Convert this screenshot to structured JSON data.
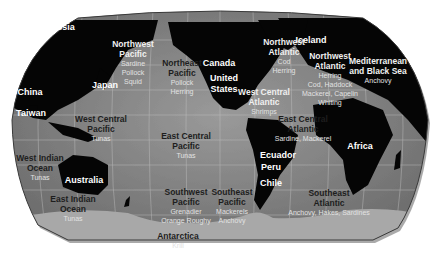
{
  "map": {
    "title": "World fishing regions",
    "colors": {
      "ocean": "#8c8c8c",
      "land": "#050505",
      "antarctica": "#a8a8a8",
      "grid": "#b8b8b8",
      "region_label": "#1e1e1e",
      "species_label": "#e2e2e2",
      "country_label": "#ffffff"
    },
    "countries": [
      {
        "name": "Russia",
        "x": 52,
        "y": 12
      },
      {
        "name": "China",
        "x": 22,
        "y": 77
      },
      {
        "name": "Japan",
        "x": 97,
        "y": 70
      },
      {
        "name": "Taiwan",
        "x": 23,
        "y": 98
      },
      {
        "name": "Australia",
        "x": 76,
        "y": 165
      },
      {
        "name": "Canada",
        "x": 211,
        "y": 48
      },
      {
        "name": "United",
        "x": 216,
        "y": 63
      },
      {
        "name": "States",
        "x": 216,
        "y": 74
      },
      {
        "name": "Iceland",
        "x": 303,
        "y": 25
      },
      {
        "name": "Africa",
        "x": 352,
        "y": 131
      },
      {
        "name": "Ecuador",
        "x": 270,
        "y": 140
      },
      {
        "name": "Peru",
        "x": 263,
        "y": 152
      },
      {
        "name": "Chile",
        "x": 263,
        "y": 168
      }
    ],
    "regions": [
      {
        "name": [
          "Northwest",
          "Pacific"
        ],
        "species": [
          "Sardine",
          "Pollock",
          "Squid"
        ],
        "x": 125,
        "y": 29,
        "tone": "light"
      },
      {
        "name": [
          "Northeast",
          "Pacific"
        ],
        "species": [
          "Pollock",
          "Herring"
        ],
        "x": 174,
        "y": 48,
        "tone": "dark"
      },
      {
        "name": [
          "Northwest",
          "Atlantic"
        ],
        "species": [
          "Cod",
          "Herring"
        ],
        "x": 276,
        "y": 27,
        "tone": "light"
      },
      {
        "name": [
          "Northwest",
          "Atlantic"
        ],
        "species": [
          "Herring",
          "Cod, Haddock",
          "Mackerel, Capelin",
          "Whiting"
        ],
        "x": 322,
        "y": 41,
        "tone": "light"
      },
      {
        "name": [
          "Mediterranean",
          "and Black Sea"
        ],
        "species": [
          "Anchovy"
        ],
        "x": 370,
        "y": 46,
        "tone": "light"
      },
      {
        "name": [
          "West Central",
          "Atlantic"
        ],
        "species": [
          "Shrimps"
        ],
        "x": 256,
        "y": 77,
        "tone": "light"
      },
      {
        "name": [
          "East Central",
          "Atlantic"
        ],
        "species": [
          "Sardine, Mackerel"
        ],
        "x": 295,
        "y": 104,
        "tone": "dark"
      },
      {
        "name": [
          "West Central",
          "Pacific"
        ],
        "species": [
          "Tunas"
        ],
        "x": 93,
        "y": 104,
        "tone": "dark"
      },
      {
        "name": [
          "East Central",
          "Pacific"
        ],
        "species": [
          "Tunas"
        ],
        "x": 178,
        "y": 121,
        "tone": "dark"
      },
      {
        "name": [
          "West Indian",
          "Ocean"
        ],
        "species": [
          "Tunas"
        ],
        "x": 32,
        "y": 143,
        "tone": "dark"
      },
      {
        "name": [
          "East Indian",
          "Ocean"
        ],
        "species": [
          "Tunas"
        ],
        "x": 65,
        "y": 184,
        "tone": "dark"
      },
      {
        "name": [
          "Southwest",
          "Pacific"
        ],
        "species": [
          "Grenadier",
          "Orange Roughy"
        ],
        "x": 178,
        "y": 177,
        "tone": "dark"
      },
      {
        "name": [
          "Southeast",
          "Pacific"
        ],
        "species": [
          "Mackerels",
          "Anchovy"
        ],
        "x": 224,
        "y": 177,
        "tone": "dark"
      },
      {
        "name": [
          "Southeast",
          "Atlantic"
        ],
        "species": [
          "Anchovy, Hakes, Sardines"
        ],
        "x": 321,
        "y": 178,
        "tone": "dark"
      },
      {
        "name": [
          "Antarctica"
        ],
        "species": [
          "Krill"
        ],
        "x": 170,
        "y": 221,
        "tone": "dark"
      }
    ]
  }
}
